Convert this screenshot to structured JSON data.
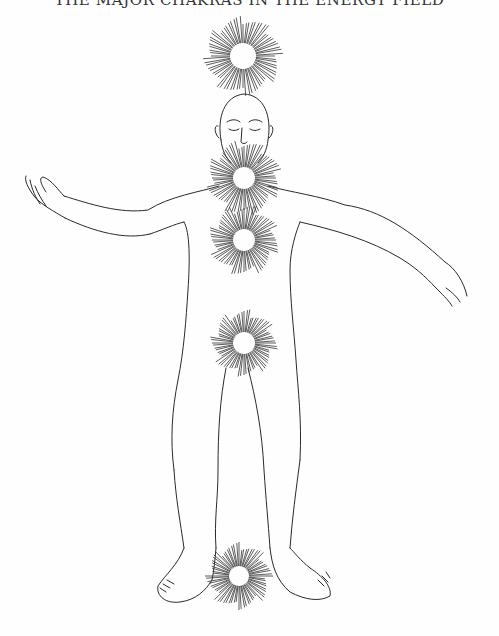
{
  "page": {
    "header": "THE MAJOR CHAKRAS IN THE ENERGY FIELD",
    "header_visibility": "partially cropped at top edge"
  },
  "illustration": {
    "subject": "standing human figure line drawing with radiating energy centers",
    "line_color": "#2a2a2a",
    "background": "#fefefe",
    "chakras": [
      {
        "name": "crown",
        "cx": 243,
        "cy": 56,
        "r_inner": 13,
        "r_outer": 36
      },
      {
        "name": "throat",
        "cx": 244,
        "cy": 178,
        "r_inner": 11,
        "r_outer": 34
      },
      {
        "name": "heart",
        "cx": 244,
        "cy": 240,
        "r_inner": 11,
        "r_outer": 32
      },
      {
        "name": "sacral",
        "cx": 244,
        "cy": 343,
        "r_inner": 11,
        "r_outer": 30
      },
      {
        "name": "root",
        "cx": 239,
        "cy": 576,
        "r_inner": 10,
        "r_outer": 30
      }
    ]
  }
}
